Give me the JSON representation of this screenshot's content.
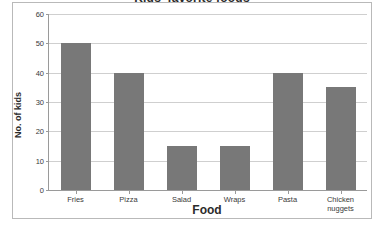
{
  "chart_data": {
    "type": "bar",
    "title": "Kids' favorite foods",
    "xlabel": "Food",
    "ylabel": "No. of kids",
    "categories": [
      "Fries",
      "Pizza",
      "Salad",
      "Wraps",
      "Pasta",
      "Chicken\nnuggets"
    ],
    "values": [
      50,
      40,
      15,
      15,
      40,
      35
    ],
    "ylim": [
      0,
      60
    ],
    "ytick_labels": [
      "0",
      "10",
      "20",
      "30",
      "40",
      "50",
      "60"
    ],
    "ytick_values": [
      0,
      10,
      20,
      30,
      40,
      50,
      60
    ],
    "grid": true,
    "legend": false,
    "bar_color": "#787878",
    "axis_color": "#9a9a9a",
    "gridline_color": "#cfcfcf",
    "background": "#ffffff"
  }
}
